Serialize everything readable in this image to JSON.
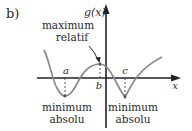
{
  "figure": {
    "part_label": "b)",
    "y_axis_label": "g(x)",
    "x_axis_label": "x",
    "points": {
      "a": "a",
      "b": "b",
      "c": "c"
    },
    "annotations": {
      "max_line1": "maximum",
      "max_line2": "relatif",
      "min_left_line1": "minimum",
      "min_left_line2": "absolu",
      "min_right_line1": "minimum",
      "min_right_line2": "absolu"
    },
    "colors": {
      "axis": "#222222",
      "curve": "#8a8a8a",
      "text": "#2a2a2a"
    }
  }
}
